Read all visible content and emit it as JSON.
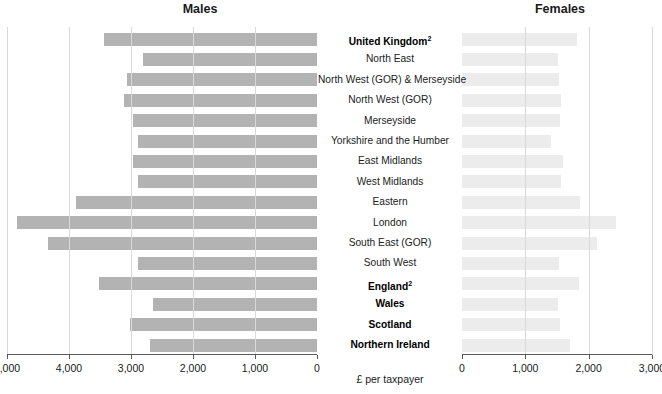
{
  "chart_data": {
    "type": "bar",
    "orientation": "horizontal-pyramid",
    "xlabel": "£ per taxpayer",
    "grid": true,
    "panels": [
      {
        "name": "males",
        "title": "Males",
        "direction": "right-to-left",
        "xlim": [
          5000,
          0
        ],
        "ticks": [
          5000,
          4000,
          3000,
          2000,
          1000,
          0
        ],
        "tick_labels": [
          "5,000",
          "4,000",
          "3,000",
          "2,000",
          "1,000",
          "0"
        ],
        "bar_color": "#b3b3b3"
      },
      {
        "name": "females",
        "title": "Females",
        "direction": "left-to-right",
        "xlim": [
          0,
          3000
        ],
        "ticks": [
          0,
          1000,
          2000,
          3000
        ],
        "tick_labels": [
          "0",
          "1,000",
          "2,000",
          "3,000"
        ],
        "bar_color": "#ececec"
      }
    ],
    "categories": [
      "United Kingdom²",
      "North East",
      "North West (GOR) & Merseyside",
      "North West (GOR)",
      "Merseyside",
      "Yorkshire and the Humber",
      "East Midlands",
      "West Midlands",
      "Eastern",
      "London",
      "South East (GOR)",
      "South West",
      "England²",
      "Wales",
      "Scotland",
      "Northern Ireland"
    ],
    "category_bold": [
      true,
      false,
      false,
      false,
      false,
      false,
      false,
      false,
      false,
      false,
      false,
      false,
      true,
      true,
      true,
      true
    ],
    "series": [
      {
        "name": "Males",
        "values": [
          3435,
          2810,
          3060,
          3120,
          2960,
          2890,
          2970,
          2890,
          3890,
          4840,
          4340,
          2880,
          3515,
          2645,
          3015,
          2690
        ]
      },
      {
        "name": "Females",
        "values": [
          1820,
          1520,
          1530,
          1570,
          1540,
          1400,
          1600,
          1570,
          1870,
          2430,
          2130,
          1530,
          1840,
          1520,
          1540,
          1700
        ]
      }
    ]
  }
}
